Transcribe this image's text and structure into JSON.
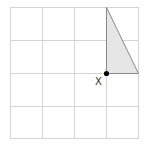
{
  "diagram": {
    "type": "grid-with-triangle",
    "grid": {
      "rows": 4,
      "cols": 4,
      "line_color": "#d4d4d4"
    },
    "triangle": {
      "fill": "#e6e6e6",
      "stroke": "#888888",
      "vertices_grid": [
        [
          3,
          0
        ],
        [
          3,
          2
        ],
        [
          4,
          2
        ]
      ]
    },
    "point": {
      "label": "X",
      "grid_position": [
        3,
        2
      ],
      "color": "#000000"
    }
  }
}
